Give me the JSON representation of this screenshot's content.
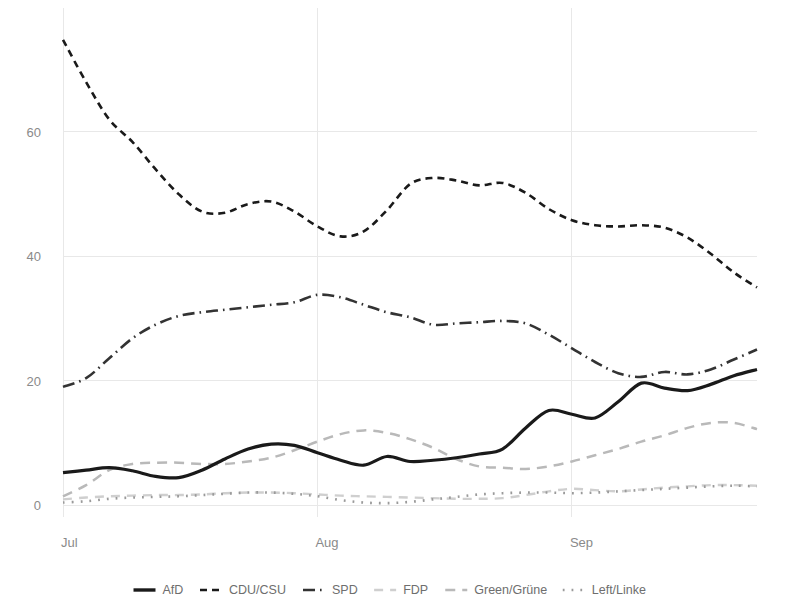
{
  "chart_data": {
    "type": "line",
    "title": "",
    "subtitle": "",
    "xlabel": "",
    "ylabel": "",
    "xlim": [
      0,
      30
    ],
    "ylim": [
      0,
      78
    ],
    "grid": true,
    "legend_position": "bottom",
    "yticks": [
      0,
      20,
      40,
      60
    ],
    "ytick_labels": [
      "0",
      "20",
      "40",
      "60"
    ],
    "xticks": [
      0,
      11,
      22
    ],
    "xtick_labels": [
      "Jul",
      "Aug",
      "Sep"
    ],
    "x": [
      0,
      1,
      2,
      3,
      4,
      5,
      6,
      7,
      8,
      9,
      10,
      11,
      12,
      13,
      14,
      15,
      16,
      17,
      18,
      19,
      20,
      21,
      22,
      23,
      24,
      25,
      26,
      27,
      28,
      29,
      30
    ],
    "series": [
      {
        "name": "AfD",
        "color": "#1a1a1a",
        "style": "solid",
        "width": 3.2,
        "values": [
          5.2,
          5.6,
          6.0,
          5.5,
          4.6,
          4.4,
          5.6,
          7.4,
          9.0,
          9.8,
          9.6,
          8.4,
          7.2,
          6.4,
          7.8,
          7.0,
          7.2,
          7.6,
          8.2,
          9.0,
          12.4,
          15.2,
          14.6,
          14.0,
          16.6,
          19.6,
          18.8,
          18.4,
          19.4,
          20.8,
          21.8
        ]
      },
      {
        "name": "CDU/CSU",
        "color": "#1a1a1a",
        "style": "dashed",
        "width": 2.6,
        "values": [
          74.8,
          68.0,
          62.0,
          58.4,
          54.0,
          50.0,
          47.2,
          47.0,
          48.4,
          48.8,
          47.2,
          44.8,
          43.2,
          44.0,
          47.4,
          51.6,
          52.6,
          52.2,
          51.4,
          51.8,
          50.2,
          47.6,
          45.8,
          45.0,
          44.8,
          45.0,
          44.6,
          43.0,
          40.4,
          37.4,
          35.0
        ]
      },
      {
        "name": "SPD",
        "color": "#333333",
        "style": "dashdot",
        "width": 2.6,
        "values": [
          19.0,
          20.4,
          23.6,
          26.8,
          29.0,
          30.4,
          31.0,
          31.4,
          31.8,
          32.2,
          32.6,
          33.8,
          33.4,
          32.2,
          31.0,
          30.2,
          29.0,
          29.2,
          29.4,
          29.6,
          29.2,
          27.4,
          25.2,
          23.0,
          21.2,
          20.6,
          21.4,
          21.0,
          21.8,
          23.4,
          25.0
        ]
      },
      {
        "name": "FDP",
        "color": "#cfcfcf",
        "style": "dashed-light",
        "width": 2.4,
        "values": [
          0.9,
          1.2,
          1.4,
          1.5,
          1.6,
          1.6,
          1.7,
          1.9,
          2.0,
          2.0,
          1.9,
          1.7,
          1.5,
          1.4,
          1.3,
          1.2,
          1.1,
          1.0,
          1.0,
          1.1,
          1.6,
          2.2,
          2.6,
          2.4,
          2.2,
          2.5,
          2.8,
          3.0,
          3.2,
          3.2,
          3.1
        ]
      },
      {
        "name": "Green/Grüne",
        "color": "#b9b9b9",
        "style": "dashed-mid",
        "width": 2.5,
        "values": [
          1.4,
          3.2,
          5.6,
          6.6,
          6.8,
          6.8,
          6.6,
          6.6,
          7.0,
          7.6,
          8.8,
          10.2,
          11.4,
          12.0,
          11.6,
          10.6,
          9.2,
          7.4,
          6.2,
          6.0,
          5.8,
          6.2,
          7.0,
          8.0,
          9.0,
          10.2,
          11.2,
          12.4,
          13.2,
          13.2,
          12.2
        ]
      },
      {
        "name": "Left/Linke",
        "color": "#9a9a9a",
        "style": "dotted",
        "width": 2.6,
        "values": [
          0.4,
          0.6,
          1.0,
          1.2,
          1.3,
          1.4,
          1.6,
          1.8,
          2.0,
          2.0,
          1.8,
          1.4,
          0.8,
          0.4,
          0.3,
          0.5,
          0.9,
          1.3,
          1.7,
          1.9,
          2.0,
          2.0,
          1.9,
          2.0,
          2.2,
          2.4,
          2.6,
          2.8,
          3.0,
          3.1,
          3.0
        ]
      }
    ]
  },
  "legend": {
    "items": [
      {
        "label": "AfD"
      },
      {
        "label": "CDU/CSU"
      },
      {
        "label": "SPD"
      },
      {
        "label": "FDP"
      },
      {
        "label": "Green/Grüne"
      },
      {
        "label": "Left/Linke"
      }
    ]
  }
}
